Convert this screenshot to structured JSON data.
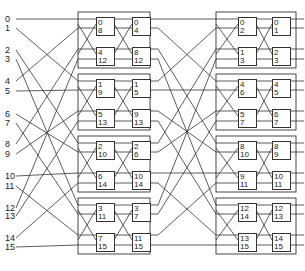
{
  "diagram": {
    "type": "interconnection network",
    "inputs": [
      "0",
      "1",
      "2",
      "3",
      "4",
      "5",
      "6",
      "7",
      "8",
      "9",
      "10",
      "11",
      "12",
      "13",
      "14",
      "15"
    ],
    "stage1": {
      "groups": [
        {
          "col_a": [
            [
              "0",
              "8"
            ],
            [
              "4",
              "12"
            ]
          ],
          "col_b": [
            [
              "0",
              "4"
            ],
            [
              "8",
              "12"
            ]
          ]
        },
        {
          "col_a": [
            [
              "1",
              "9"
            ],
            [
              "5",
              "13"
            ]
          ],
          "col_b": [
            [
              "1",
              "5"
            ],
            [
              "9",
              "13"
            ]
          ]
        },
        {
          "col_a": [
            [
              "2",
              "10"
            ],
            [
              "6",
              "14"
            ]
          ],
          "col_b": [
            [
              "2",
              "6"
            ],
            [
              "10",
              "14"
            ]
          ]
        },
        {
          "col_a": [
            [
              "3",
              "11"
            ],
            [
              "7",
              "15"
            ]
          ],
          "col_b": [
            [
              "3",
              "7"
            ],
            [
              "11",
              "15"
            ]
          ]
        }
      ]
    },
    "stage2": {
      "groups": [
        {
          "col_a": [
            [
              "0",
              "2"
            ],
            [
              "1",
              "3"
            ]
          ],
          "col_b": [
            [
              "0",
              "1"
            ],
            [
              "2",
              "3"
            ]
          ]
        },
        {
          "col_a": [
            [
              "4",
              "6"
            ],
            [
              "5",
              "7"
            ]
          ],
          "col_b": [
            [
              "4",
              "5"
            ],
            [
              "6",
              "7"
            ]
          ]
        },
        {
          "col_a": [
            [
              "8",
              "10"
            ],
            [
              "9",
              "11"
            ]
          ],
          "col_b": [
            [
              "8",
              "9"
            ],
            [
              "10",
              "11"
            ]
          ]
        },
        {
          "col_a": [
            [
              "12",
              "14"
            ],
            [
              "13",
              "15"
            ]
          ],
          "col_b": [
            [
              "12",
              "13"
            ],
            [
              "14",
              "15"
            ]
          ]
        }
      ]
    },
    "line_color": "#333333"
  }
}
